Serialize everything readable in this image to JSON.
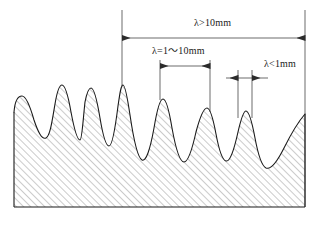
{
  "diagram": {
    "colors": {
      "line": "#1a1a1a",
      "hatch": "#8c8c8c",
      "background": "#ffffff",
      "dimension": "#2b2b2b"
    },
    "profile": {
      "description": "Wavy machined surface cross-section with hatched solid body",
      "left_edge_x": 14,
      "right_edge_x": 305,
      "base_y": 207,
      "peaks": [
        {
          "x": 22,
          "y": 96
        },
        {
          "x": 55,
          "y": 85
        },
        {
          "x": 83,
          "y": 88
        },
        {
          "x": 122,
          "y": 85
        },
        {
          "x": 162,
          "y": 99
        },
        {
          "x": 207,
          "y": 108
        },
        {
          "x": 245,
          "y": 111
        }
      ]
    },
    "dimensions": [
      {
        "name": "long-wavelength",
        "label": "λ>10mm",
        "label_x": 194,
        "label_y": 23,
        "line_y": 38,
        "start_x": 122,
        "end_x": 305,
        "arrow_direction": "inward",
        "extension_left_x": 122,
        "extension_left_top": 10,
        "extension_left_bottom": 86,
        "extension_right_x": 305,
        "extension_right_top": 10,
        "extension_right_bottom": 207
      },
      {
        "name": "medium-wavelength",
        "label": "λ=1～10mm",
        "label_x": 152,
        "label_y": 48,
        "line_y": 66,
        "start_x": 160,
        "end_x": 210,
        "arrow_direction": "inward",
        "extension_left_x": 160,
        "extension_left_top": 60,
        "extension_left_bottom": 100,
        "extension_right_x": 210,
        "extension_right_top": 60,
        "extension_right_bottom": 112
      },
      {
        "name": "short-wavelength",
        "label": "λ<1mm",
        "label_x": 264,
        "label_y": 64,
        "line_y": 78,
        "start_x": 238,
        "end_x": 252,
        "arrow_direction": "outward",
        "extension_left_x": 238,
        "extension_left_top": 70,
        "extension_left_bottom": 118,
        "extension_right_x": 252,
        "extension_right_top": 70,
        "extension_right_bottom": 118
      }
    ]
  }
}
